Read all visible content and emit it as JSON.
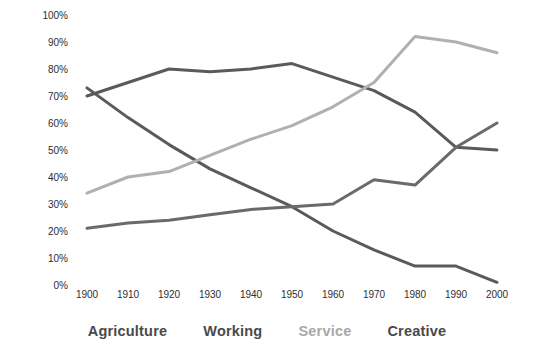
{
  "chart_data": {
    "type": "line",
    "title": "",
    "subtitle": "",
    "xlabel": "",
    "ylabel": "",
    "x": [
      1900,
      1910,
      1920,
      1930,
      1940,
      1950,
      1960,
      1970,
      1980,
      1990,
      2000
    ],
    "xtick_labels": [
      "1900",
      "1910",
      "1920",
      "1930",
      "1940",
      "1950",
      "1960",
      "1970",
      "1980",
      "1990",
      "2000"
    ],
    "ytick_labels": [
      "100%",
      "90%",
      "80%",
      "70%",
      "60%",
      "50%",
      "40%",
      "30%",
      "20%",
      "10%",
      "0%"
    ],
    "ytick_values": [
      100,
      90,
      80,
      70,
      60,
      50,
      40,
      30,
      20,
      10,
      0
    ],
    "ylim": [
      0,
      100
    ],
    "xlim": [
      1900,
      2000
    ],
    "grid": false,
    "legend_position": "bottom",
    "series": [
      {
        "name": "Agriculture",
        "color": "#5a5a5a",
        "values": [
          73,
          62,
          52,
          43,
          36,
          29,
          20,
          13,
          7,
          7,
          1
        ]
      },
      {
        "name": "Working",
        "color": "#5a5a5a",
        "values": [
          70,
          75,
          80,
          79,
          80,
          82,
          77,
          72,
          64,
          51,
          50
        ]
      },
      {
        "name": "Service",
        "color": "#b0b0b0",
        "values": [
          34,
          40,
          42,
          48,
          54,
          59,
          66,
          75,
          92,
          90,
          86
        ]
      },
      {
        "name": "Creative",
        "color": "#6a6a6a",
        "values": [
          21,
          23,
          24,
          26,
          28,
          29,
          30,
          39,
          37,
          51,
          60
        ]
      }
    ]
  },
  "legend": {
    "items": [
      {
        "label": "Agriculture",
        "color": "#4a4a4a"
      },
      {
        "label": "Working",
        "color": "#4a4a4a"
      },
      {
        "label": "Service",
        "color": "#a8a8a8"
      },
      {
        "label": "Creative",
        "color": "#4a4a4a"
      }
    ]
  },
  "axes": {
    "y_axis_name": "percent-axis",
    "x_axis_name": "year-axis"
  }
}
